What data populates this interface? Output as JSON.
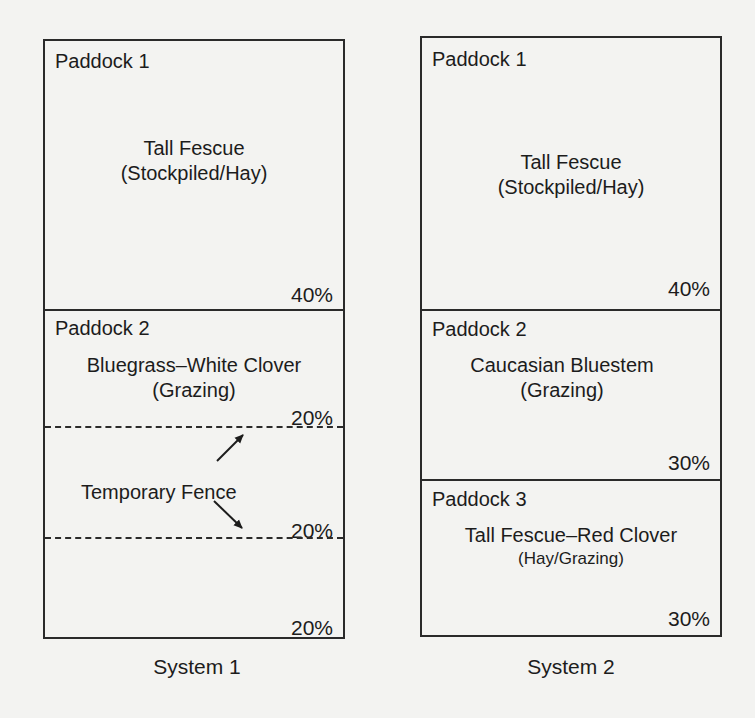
{
  "figure": {
    "systems": [
      {
        "caption": "System 1",
        "paddocks": [
          {
            "label": "Paddock 1",
            "crop": "Tall Fescue",
            "use": "(Stockpiled/Hay)",
            "percent": "40%"
          },
          {
            "label": "Paddock 2",
            "crop": "Bluegrass–White Clover",
            "use": "(Grazing)",
            "subdivisions": [
              "20%",
              "20%",
              "20%"
            ],
            "fence_label": "Temporary Fence"
          }
        ]
      },
      {
        "caption": "System 2",
        "paddocks": [
          {
            "label": "Paddock 1",
            "crop": "Tall Fescue",
            "use": "(Stockpiled/Hay)",
            "percent": "40%"
          },
          {
            "label": "Paddock 2",
            "crop": "Caucasian Bluestem",
            "use": "(Grazing)",
            "percent": "30%"
          },
          {
            "label": "Paddock 3",
            "crop": "Tall Fescue–Red Clover",
            "use": "(Hay/Grazing)",
            "percent": "30%"
          }
        ]
      }
    ],
    "colors": {
      "line": "#2a2a2a",
      "text": "#1c1c1c",
      "background": "#f3f3f1"
    }
  }
}
